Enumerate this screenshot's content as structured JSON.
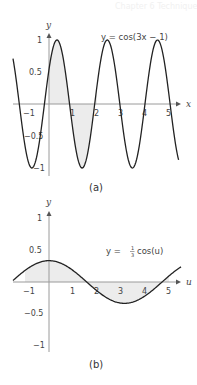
{
  "header": {
    "faint_text": "Chapter 6 Techniques of Antidifferentiation"
  },
  "chart_data": [
    {
      "type": "line",
      "panel": "(a)",
      "function": "y = cos(3x - 1)",
      "annotation": "y = cos(3x − 1)",
      "xlabel": "x",
      "ylabel": "y",
      "xlim": [
        -1.5,
        5.5
      ],
      "ylim": [
        -1.1,
        1.1
      ],
      "x_ticks": [
        -1,
        1,
        2,
        3,
        4,
        5
      ],
      "x_tick_labels": [
        "−1",
        "1",
        "2",
        "3",
        "4",
        "5"
      ],
      "y_ticks": [
        1,
        0.5,
        -0.5,
        -1
      ],
      "y_tick_labels": [
        "1",
        "0.5",
        "−0.5",
        "−1"
      ],
      "shaded_interval": [
        0,
        2
      ],
      "grid": false,
      "caption": "(a)"
    },
    {
      "type": "line",
      "panel": "(b)",
      "function": "y = (1/3) cos(u)",
      "annotation_prefix": "y = ",
      "annotation_frac_num": "1",
      "annotation_frac_den": "3",
      "annotation_suffix": "cos(u)",
      "xlabel": "u",
      "ylabel": "y",
      "xlim": [
        -1.5,
        5.5
      ],
      "ylim": [
        -1.1,
        1.1
      ],
      "x_ticks": [
        -1,
        1,
        2,
        3,
        4,
        5
      ],
      "x_tick_labels": [
        "−1",
        "1",
        "2",
        "3",
        "4",
        "5"
      ],
      "y_ticks": [
        1,
        0.5,
        -0.5,
        -1
      ],
      "y_tick_labels": [
        "1",
        "0.5",
        "−0.5",
        "−1"
      ],
      "shaded_interval": [
        -1,
        5
      ],
      "grid": false,
      "caption": "(b)"
    }
  ],
  "colors": {
    "curve": "#222222",
    "axis": "#9a9a9a",
    "shade": "#ececec",
    "text": "#444444"
  }
}
